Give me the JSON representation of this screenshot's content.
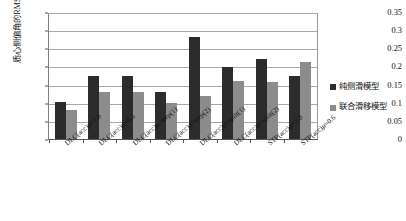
{
  "chart_data": {
    "type": "bar",
    "title": "",
    "xlabel": "",
    "ylabel": "质心侧偏角的RMSE/(°)",
    "ylim": [
      0,
      0.35
    ],
    "ytick_step": 0.05,
    "yticks": [
      "0",
      "0.05",
      "0.1",
      "0.15",
      "0.2",
      "0.25",
      "0.3",
      "0.35"
    ],
    "grid": true,
    "legend_position": "right",
    "categories": [
      "DLC(acc)μ=1.0",
      "DLC(acc)μ=0.5",
      "DLC(acc)μ=step(1)",
      "DLC(acc)μ=step(2)",
      "DLC(acc)μ=split(1)",
      "DLC(acc)μ=split(2)",
      "STP(acc)μ=1.0",
      "STP(acc)μ=0.6"
    ],
    "series": [
      {
        "name": "纯侧滑模型",
        "color": "#2c2c2c",
        "values": [
          0.103,
          0.177,
          0.177,
          0.132,
          0.287,
          0.201,
          0.224,
          0.177
        ]
      },
      {
        "name": "联合滑移模型",
        "color": "#8c8c8c",
        "values": [
          0.081,
          0.133,
          0.132,
          0.101,
          0.12,
          0.162,
          0.16,
          0.217
        ]
      }
    ]
  }
}
